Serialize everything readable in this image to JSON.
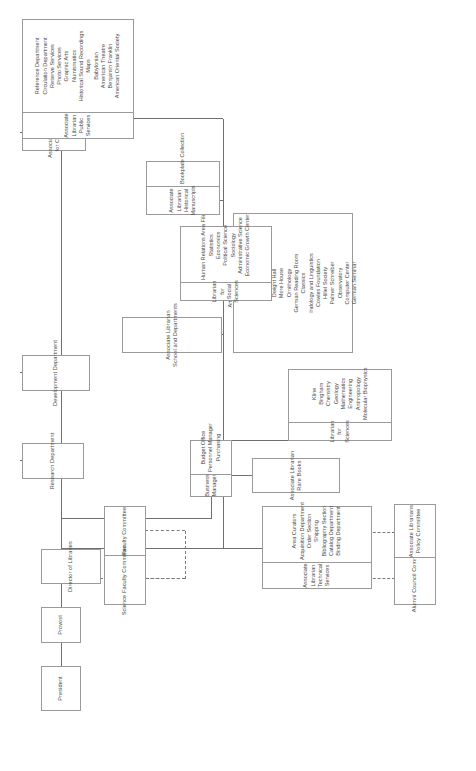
{
  "chart_title": "Yale University Library Organization Chart",
  "nodes": {
    "president": {
      "lines": [
        "President"
      ]
    },
    "provost": {
      "lines": [
        "Provost"
      ]
    },
    "director": {
      "lines": [
        "Director of Libraries"
      ]
    },
    "faculty_committee": {
      "lines": [
        "Faculty Committee"
      ]
    },
    "science_faculty_committee": {
      "lines": [
        "Science Faculty Committee"
      ]
    },
    "alumni_council_committee": {
      "lines": [
        "Alumni Council Committee"
      ]
    },
    "associate_librarians_policy_committee": {
      "lines": [
        "Associate Librarians",
        "Policy Committee"
      ]
    },
    "development_department": {
      "lines": [
        "Development Department"
      ]
    },
    "research_department": {
      "lines": [
        "Research Department"
      ]
    },
    "assoc_librarian_collections": {
      "lines": [
        "Associate Librarian",
        "for Collections"
      ]
    },
    "assoc_librarian_public_services": {
      "lines": [
        "Associate Librarian",
        "Public Services"
      ]
    },
    "assoc_librarian_historical_manuscripts": {
      "lines": [
        "Associate Librarian",
        "Historical Manuscripts"
      ]
    },
    "bookplate_collection": {
      "lines": [
        "Bookplate Collection"
      ]
    },
    "assoc_librarian_school_and_departments": {
      "lines": [
        "Associate Librarian",
        "School and Departments"
      ]
    },
    "assoc_librarian_rare_books": {
      "lines": [
        "Associate Librarian",
        "Rare Books"
      ]
    },
    "assoc_librarian_technical_services": {
      "lines": [
        "Associate Librarian",
        "Technical Services"
      ]
    },
    "librarian_for_social_sciences": {
      "lines": [
        "Librarian for Social Sciences"
      ]
    },
    "librarian_for_sciences": {
      "lines": [
        "Librarian for Sciences"
      ]
    }
  },
  "business_manager": {
    "header": [
      "Business Manager"
    ],
    "items": [
      "Budget Office",
      "Personnel Manager",
      "Purchasing"
    ]
  },
  "public_services": {
    "header": [
      "Associate Librarian",
      "Public Services"
    ],
    "items": [
      "Reference Department",
      "Circulation Department",
      "Reserve Services",
      "Photo Services",
      "Graphic Arts",
      "Numismatics",
      "Historical Sound Recordings",
      "Maps",
      "Babylonian",
      "American Theatre",
      "Benjamin Franklin",
      "American Oriental Society"
    ]
  },
  "historical_manuscripts": {
    "header": [
      "Associate Librarian",
      "Historical Manuscripts"
    ],
    "items": [
      "Bookplate Collection"
    ]
  },
  "social_sciences": {
    "header": [
      "Librarian for Social Sciences"
    ],
    "items": [
      "Human Relations Area Files",
      "Statistics",
      "Economics",
      "Political Science",
      "Sociology",
      "Administrative Science",
      "Economic Growth Center"
    ]
  },
  "school_and_departments": {
    "header": [
      "Associate Librarian",
      "School and Departments"
    ],
    "items": [
      "Art and Architecture",
      "Divinity",
      "Drama",
      "Forestry",
      "Medical",
      "Music",
      "Dwight Hall",
      "More House",
      "Ornithology",
      "German Reading Room",
      "Classics",
      "Indology and Linguistics",
      "Cowles Foundation",
      "Hillel Society",
      "Palmer Schreiber",
      "Observatory",
      "Computer Center",
      "German Seminar"
    ]
  },
  "sciences": {
    "header": [
      "Librarian for Sciences"
    ],
    "items": [
      "Kline",
      "Bingham",
      "Chemistry",
      "Geology",
      "Mathematics",
      "Engineering",
      "Anthropology",
      "Molecular Biophysics"
    ]
  },
  "technical_services": {
    "header": [
      "Associate Librarian",
      "Technical Services"
    ],
    "items": [
      "Area Curators",
      "Acquisition Department",
      "Order Section",
      "Shipping",
      "Bibliography Section",
      "Catalog Department",
      "Binding Department"
    ]
  },
  "colors": {
    "box_border": "#9a9a9a",
    "text": "#4a4a4a",
    "connector": "#6f6f6f",
    "background": "#ffffff"
  }
}
